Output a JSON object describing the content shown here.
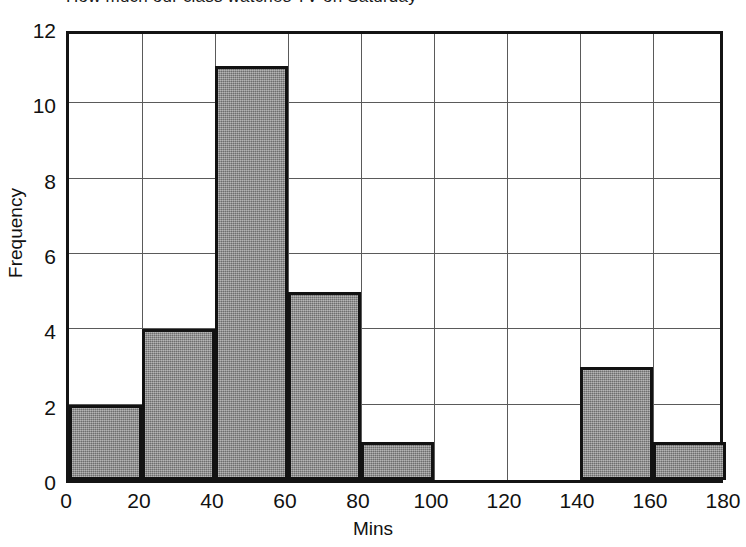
{
  "chart_data": {
    "type": "bar",
    "title": "How much our class watches TV on Saturday",
    "xlabel": "Mins",
    "ylabel": "Frequency",
    "categories": [
      "0-20",
      "20-40",
      "40-60",
      "60-80",
      "80-100",
      "100-120",
      "120-140",
      "140-160",
      "160-180"
    ],
    "bin_edges": [
      0,
      20,
      40,
      60,
      80,
      100,
      120,
      140,
      160,
      180
    ],
    "values": [
      2,
      4,
      11,
      5,
      1,
      0,
      0,
      3,
      1
    ],
    "xlim": [
      0,
      180
    ],
    "ylim": [
      0,
      12
    ],
    "xticks": [
      "0",
      "20",
      "40",
      "60",
      "80",
      "100",
      "120",
      "140",
      "160",
      "180"
    ],
    "yticks": [
      "0",
      "2",
      "4",
      "6",
      "8",
      "10",
      "12"
    ],
    "xtick_values": [
      0,
      20,
      40,
      60,
      80,
      100,
      120,
      140,
      160,
      180
    ],
    "ytick_values": [
      0,
      2,
      4,
      6,
      8,
      10,
      12
    ],
    "grid": true,
    "legend": null,
    "bar_fill_color": "#888888",
    "bar_edge_color": "#121212",
    "grid_color": "#5a5a5a",
    "axis_color": "#141414",
    "background_color": "#ffffff"
  }
}
